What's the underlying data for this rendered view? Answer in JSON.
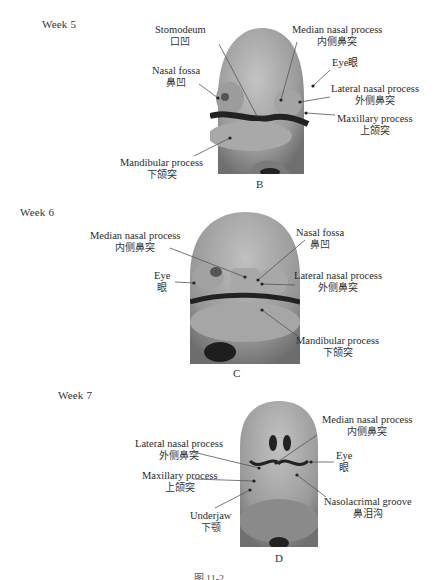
{
  "figure": {
    "caption_partial": "图 11-2 ……",
    "panels": [
      {
        "id": "B",
        "week": "Week 5",
        "letter": "B",
        "labels": [
          {
            "en": "Stomodeum",
            "zh": "口凹"
          },
          {
            "en": "Nasal fossa",
            "zh": "鼻凹"
          },
          {
            "en": "Mandibular process",
            "zh": "下颌突"
          },
          {
            "en": "Median nasal process",
            "zh": "内侧鼻突"
          },
          {
            "en": "Eye",
            "zh": "眼"
          },
          {
            "en": "Lateral nasal process",
            "zh": "外侧鼻突"
          },
          {
            "en": "Maxillary process",
            "zh": "上颌突"
          }
        ]
      },
      {
        "id": "C",
        "week": "Week 6",
        "letter": "C",
        "labels": [
          {
            "en": "Median nasal process",
            "zh": "内侧鼻突"
          },
          {
            "en": "Eye",
            "zh": "眼"
          },
          {
            "en": "Nasal fossa",
            "zh": "鼻凹"
          },
          {
            "en": "Lateral nasal process",
            "zh": "外侧鼻突"
          },
          {
            "en": "Mandibular process",
            "zh": "下颌突"
          }
        ]
      },
      {
        "id": "D",
        "week": "Week 7",
        "letter": "D",
        "labels": [
          {
            "en": "Lateral nasal process",
            "zh": "外侧鼻突"
          },
          {
            "en": "Maxillary process",
            "zh": "上颌突"
          },
          {
            "en": "Underjaw",
            "zh": "下颚"
          },
          {
            "en": "Median nasal process",
            "zh": "内侧鼻突"
          },
          {
            "en": "Eye",
            "zh": "眼"
          },
          {
            "en": "Nasolacrimal groove",
            "zh": "鼻泪沟"
          }
        ]
      }
    ],
    "colors": {
      "embryo_light": "#b8b8b8",
      "embryo_dark": "#6a6a6a",
      "groove": "#1e1e1e",
      "leader": "#555555"
    }
  }
}
